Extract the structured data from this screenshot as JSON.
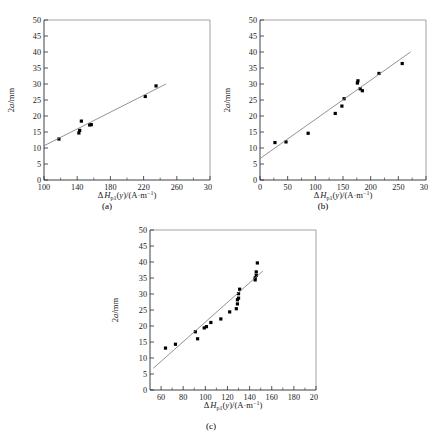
{
  "figure": {
    "panels": [
      {
        "id": "a",
        "caption": "(a)",
        "chart_data": {
          "type": "scatter",
          "title": "",
          "xlabel": "ΔH_p1(y)/(A·m⁻¹)",
          "ylabel": "2a/mm",
          "xlim": [
            100,
            300
          ],
          "ylim": [
            0,
            50
          ],
          "xticks": [
            100,
            140,
            180,
            220,
            260,
            300
          ],
          "yticks": [
            0,
            5,
            10,
            15,
            20,
            25,
            30,
            35,
            40,
            45,
            50
          ],
          "grid": false,
          "legend": "none",
          "x": [
            118,
            142,
            143,
            145,
            155,
            157,
            222,
            235
          ],
          "y": [
            12.8,
            14.7,
            15.5,
            18.4,
            17.2,
            17.3,
            26.1,
            29.4
          ],
          "fit_line": {
            "x": [
              100,
              247
            ],
            "y": [
              10.7,
              30.0
            ]
          }
        }
      },
      {
        "id": "b",
        "caption": "(b)",
        "chart_data": {
          "type": "scatter",
          "title": "",
          "xlabel": "ΔH_p1(y)/(A·m⁻¹)",
          "ylabel": "2a/mm",
          "xlim": [
            0,
            300
          ],
          "ylim": [
            0,
            50
          ],
          "xticks": [
            0,
            50,
            100,
            150,
            200,
            250,
            300
          ],
          "yticks": [
            0,
            5,
            10,
            15,
            20,
            25,
            30,
            35,
            40,
            45,
            50
          ],
          "grid": false,
          "legend": "none",
          "x": [
            27,
            47,
            87,
            136,
            148,
            152,
            176,
            177,
            181,
            185,
            215,
            257
          ],
          "y": [
            11.7,
            11.9,
            14.6,
            20.8,
            23.1,
            25.4,
            30.3,
            31.0,
            28.5,
            27.9,
            33.3,
            36.4
          ],
          "fit_line": {
            "x": [
              0,
              272
            ],
            "y": [
              6.7,
              40.0
            ]
          }
        }
      },
      {
        "id": "c",
        "caption": "(c)",
        "chart_data": {
          "type": "scatter",
          "title": "",
          "xlabel": "ΔH_p1(y)/(A·m⁻¹)",
          "ylabel": "2a/mm",
          "xlim": [
            50,
            200
          ],
          "ylim": [
            0,
            50
          ],
          "xticks": [
            60,
            80,
            100,
            120,
            140,
            160,
            180,
            200
          ],
          "yticks": [
            0,
            5,
            10,
            15,
            20,
            25,
            30,
            35,
            40,
            45,
            50
          ],
          "grid": false,
          "legend": "none",
          "x": [
            64,
            73,
            91,
            93,
            99,
            101,
            105,
            114,
            122,
            128,
            129,
            129,
            130,
            130,
            131,
            145,
            145,
            146,
            146,
            147
          ],
          "y": [
            13.1,
            14.3,
            18.2,
            16.0,
            19.4,
            19.8,
            21.1,
            22.2,
            24.4,
            25.4,
            26.9,
            28.2,
            28.7,
            30.1,
            31.5,
            34.4,
            35.0,
            35.8,
            36.9,
            39.7
          ],
          "fit_line": {
            "x": [
              53,
              152
            ],
            "y": [
              6.8,
              37.2
            ]
          }
        }
      }
    ],
    "axis_label_parts": {
      "delta": "Δ",
      "h": "H",
      "subscript": "p1",
      "of_y": "(y)/(A·m",
      "exponent": "−1",
      "close": ")",
      "y_axis_number": "2",
      "y_axis_italic": "a",
      "y_axis_unit": "/mm"
    }
  }
}
